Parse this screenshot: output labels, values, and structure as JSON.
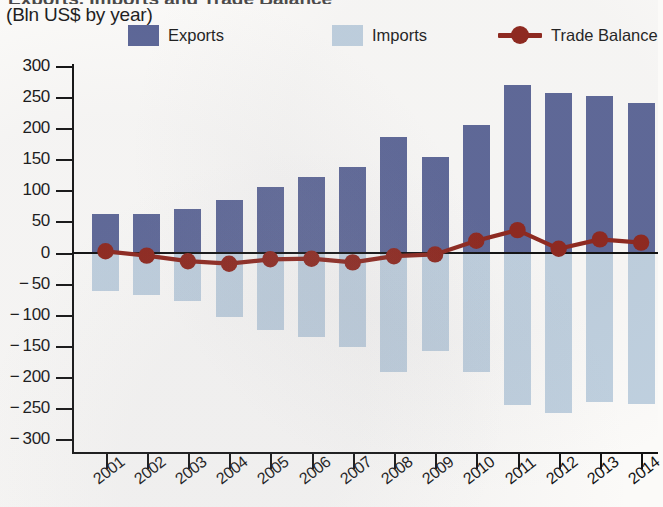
{
  "header": {
    "title_cropped": "Exports, Imports and Trade Balance",
    "subtitle": "(Bln US$ by year)"
  },
  "legend": {
    "position": "top",
    "items": [
      {
        "label": "Exports",
        "color": "#5b6596",
        "marker": "square-swatch"
      },
      {
        "label": "Imports",
        "color": "#bfd0df",
        "marker": "square-swatch"
      },
      {
        "label": "Trade Balance",
        "color": "#8d2319",
        "marker": "line-with-circle"
      }
    ]
  },
  "colors": {
    "exports": "#5b6596",
    "imports": "#bfd0df",
    "balance": "#8d2319",
    "axis": "#111111",
    "background": "#fbfaf8"
  },
  "chart_data": {
    "type": "bar",
    "title": "Exports, Imports and Trade Balance",
    "subtitle": "(Bln US$ by year)",
    "xlabel": "",
    "ylabel": "Bln US$ by year",
    "ylim": [
      -300,
      300
    ],
    "ytick_step": 50,
    "yticks": [
      300,
      250,
      200,
      150,
      100,
      50,
      0,
      -50,
      -100,
      -150,
      -200,
      -250,
      -300
    ],
    "ytick_labels": [
      "300",
      "250",
      "200",
      "150",
      "100",
      "50",
      "0",
      "− 50",
      "− 100",
      "− 150",
      "− 200",
      "− 250",
      "− 300"
    ],
    "grid": false,
    "legend_position": "top",
    "categories": [
      "2001",
      "2002",
      "2003",
      "2004",
      "2005",
      "2006",
      "2007",
      "2008",
      "2009",
      "2010",
      "2011",
      "2012",
      "2013",
      "2014"
    ],
    "series": [
      {
        "name": "Exports",
        "type": "bar",
        "color": "#5b6596",
        "values": [
          62,
          62,
          70,
          85,
          105,
          122,
          138,
          185,
          153,
          205,
          270,
          256,
          251,
          240
        ]
      },
      {
        "name": "Imports",
        "type": "bar",
        "color": "#bfd0df",
        "values": [
          -62,
          -68,
          -78,
          -104,
          -124,
          -136,
          -152,
          -192,
          -158,
          -192,
          -245,
          -258,
          -240,
          -243
        ]
      },
      {
        "name": "Trade Balance",
        "type": "line",
        "color": "#8d2319",
        "values": [
          2,
          -5,
          -14,
          -18,
          -11,
          -10,
          -16,
          -6,
          -3,
          19,
          36,
          6,
          21,
          16
        ]
      }
    ]
  }
}
